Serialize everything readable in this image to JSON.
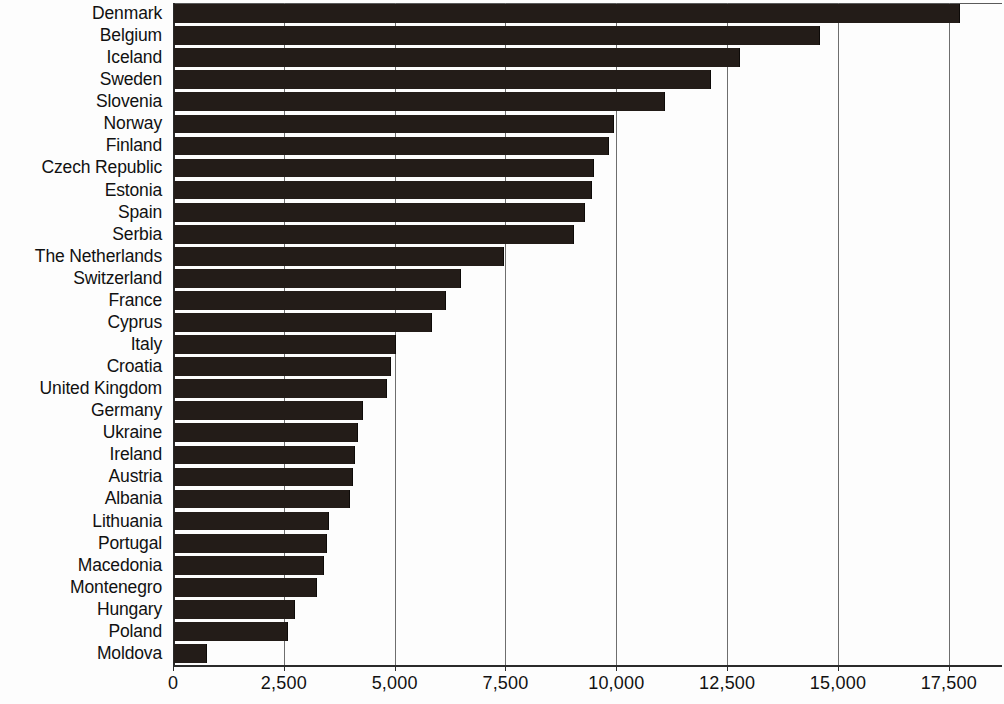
{
  "chart_data": {
    "type": "bar",
    "orientation": "horizontal",
    "title": "",
    "subtitle": "",
    "xlabel": "",
    "ylabel": "",
    "xlim": [
      0,
      18700
    ],
    "grid": true,
    "grid_axis": "x",
    "legend": false,
    "legend_position": "none",
    "bar_color": "#231c18",
    "xticks": [
      0,
      2500,
      5000,
      7500,
      10000,
      12500,
      15000,
      17500
    ],
    "xtick_labels": [
      "0",
      "2,500",
      "5,000",
      "7,500",
      "10,000",
      "12,500",
      "15,000",
      "17,500"
    ],
    "categories": [
      "Denmark",
      "Belgium",
      "Iceland",
      "Sweden",
      "Slovenia",
      "Norway",
      "Finland",
      "Czech Republic",
      "Estonia",
      "Spain",
      "Serbia",
      "The Netherlands",
      "Switzerland",
      "France",
      "Cyprus",
      "Italy",
      "Croatia",
      "United Kingdom",
      "Germany",
      "Ukraine",
      "Ireland",
      "Austria",
      "Albania",
      "Lithuania",
      "Portugal",
      "Macedonia",
      "Montenegro",
      "Hungary",
      "Poland",
      "Moldova"
    ],
    "values": [
      17700,
      14560,
      12750,
      12100,
      11060,
      9900,
      9800,
      9450,
      9400,
      9250,
      9000,
      7430,
      6450,
      6120,
      5800,
      4980,
      4870,
      4780,
      4230,
      4130,
      4060,
      4010,
      3950,
      3470,
      3420,
      3350,
      3210,
      2700,
      2550,
      730
    ]
  }
}
